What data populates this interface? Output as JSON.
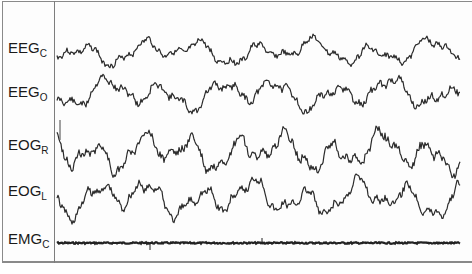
{
  "figure": {
    "type": "polysomnography-traces",
    "channels": [
      {
        "id": "eeg_c",
        "base": "EEG",
        "sub": "C",
        "y": 52,
        "amp": 14,
        "seed": 3,
        "freq": 1.0
      },
      {
        "id": "eeg_o",
        "base": "EEG",
        "sub": "O",
        "y": 94,
        "amp": 17,
        "seed": 11,
        "freq": 1.0
      },
      {
        "id": "eog_r",
        "base": "EOG",
        "sub": "R",
        "y": 152,
        "amp": 22,
        "seed": 23,
        "freq": 1.2
      },
      {
        "id": "eog_l",
        "base": "EOG",
        "sub": "L",
        "y": 198,
        "amp": 20,
        "seed": 41,
        "freq": 1.1
      },
      {
        "id": "emg_c",
        "base": "EMG",
        "sub": "C",
        "y": 243,
        "amp": 1,
        "seed": 7,
        "freq": 3.0
      }
    ],
    "colors": {
      "trace": "#2b2b2b",
      "frame": "#8a8a8a",
      "label": "#1a1a1a"
    }
  }
}
